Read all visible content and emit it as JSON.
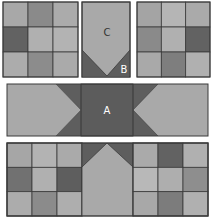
{
  "diagram": {
    "colors": {
      "light": "#a9a9a9",
      "lighter": "#b3b3b3",
      "medium": "#8a8a8a",
      "dark": "#626262",
      "darker": "#575757",
      "outline": "#3a3a3a",
      "label_on_dark": "#ffffff",
      "label_on_light": "#333333"
    },
    "labels": {
      "a": "A",
      "b": "B",
      "c": "C"
    },
    "top_left_ninepatch": {
      "cells": [
        [
          "#a8a8a8",
          "#8a8a8a",
          "#ababab"
        ],
        [
          "#626262",
          "#b0b0b0",
          "#b3b3b3"
        ],
        [
          "#acacac",
          "#8c8c8c",
          "#aaaaaa"
        ]
      ]
    },
    "top_right_ninepatch": {
      "cells": [
        [
          "#a4a4a4",
          "#b5b5b5",
          "#aaaaaa"
        ],
        [
          "#8a8a8a",
          "#b0b0b0",
          "#626262"
        ],
        [
          "#a9a9a9",
          "#7e7e7e",
          "#b0b0b0"
        ]
      ]
    },
    "bottom_left_ninepatch": {
      "cells": [
        [
          "#a6a6a6",
          "#b3b3b3",
          "#aaaaaa"
        ],
        [
          "#717171",
          "#b0b0b0",
          "#5e5e5e"
        ],
        [
          "#acacac",
          "#8b8b8b",
          "#aeaeae"
        ]
      ]
    },
    "bottom_right_ninepatch": {
      "cells": [
        [
          "#aaaaaa",
          "#626262",
          "#b0b0b0"
        ],
        [
          "#b8b8b8",
          "#aeaeae",
          "#8e8e8e"
        ],
        [
          "#a8a8a8",
          "#7c7c7c",
          "#b0b0b0"
        ]
      ]
    }
  }
}
